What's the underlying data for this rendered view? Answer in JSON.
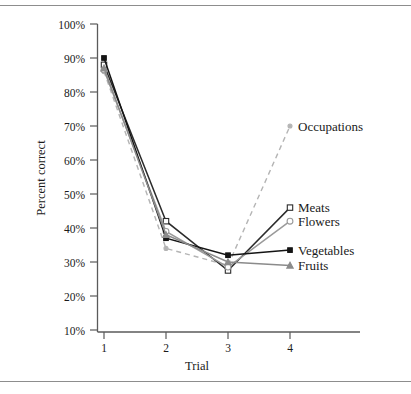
{
  "figure": {
    "name": "percent-correct-by-trial-figure",
    "has_top_rule": true,
    "has_bottom_rule": true
  },
  "chart_data": {
    "type": "line",
    "title": "",
    "xlabel": "Trial",
    "ylabel": "Percent correct",
    "x": [
      1,
      2,
      3,
      4
    ],
    "xtick_labels": [
      "1",
      "2",
      "3",
      "4"
    ],
    "ytick_labels": [
      "10%",
      "20%",
      "30%",
      "40%",
      "50%",
      "60%",
      "70%",
      "80%",
      "90%",
      "100%"
    ],
    "ytick_values": [
      10,
      20,
      30,
      40,
      50,
      60,
      70,
      80,
      90,
      100
    ],
    "ylim": [
      0,
      100
    ],
    "xlim": [
      0.55,
      4.6
    ],
    "grid": false,
    "legend_position": "right-inline-labels",
    "series": [
      {
        "name": "Occupations",
        "values": [
          86,
          34,
          29,
          70
        ],
        "color": "#b4b4b4",
        "line_style": "dashed",
        "marker": "circle-small",
        "marker_fill": "#b4b4b4",
        "label_y_percent": 70
      },
      {
        "name": "Meats",
        "values": [
          88,
          42,
          27.5,
          46
        ],
        "color": "#2b2b2b",
        "line_style": "solid",
        "marker": "square-open",
        "marker_fill": "#ffffff",
        "label_y_percent": 46
      },
      {
        "name": "Flowers",
        "values": [
          86.5,
          39,
          28.5,
          42
        ],
        "color": "#9a9a9a",
        "line_style": "solid",
        "marker": "circle-open",
        "marker_fill": "#ffffff",
        "label_y_percent": 42
      },
      {
        "name": "Vegetables",
        "values": [
          90,
          37,
          32,
          33.5
        ],
        "color": "#141414",
        "line_style": "solid",
        "marker": "square-filled",
        "marker_fill": "#141414",
        "label_y_percent": 33.5
      },
      {
        "name": "Fruits",
        "values": [
          87,
          38,
          30,
          29
        ],
        "color": "#8b8b8b",
        "line_style": "solid",
        "marker": "triangle-filled",
        "marker_fill": "#8b8b8b",
        "label_y_percent": 29
      }
    ]
  },
  "axis": {
    "y_title": "Percent correct",
    "x_title": "Trial",
    "y_labels": {
      "t100": "100%",
      "t90": "90%",
      "t80": "80%",
      "t70": "70%",
      "t60": "60%",
      "t50": "50%",
      "t40": "40%",
      "t30": "30%",
      "t20": "20%",
      "t10": "10%"
    },
    "x_labels": {
      "t1": "1",
      "t2": "2",
      "t3": "3",
      "t4": "4"
    }
  },
  "series_labels": {
    "occupations": "Occupations",
    "meats": "Meats",
    "flowers": "Flowers",
    "vegetables": "Vegetables",
    "fruits": "Fruits"
  }
}
